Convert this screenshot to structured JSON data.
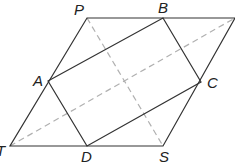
{
  "figure": {
    "type": "geometric-diagram",
    "colors": {
      "solid_line": "#333333",
      "dashed_line": "#b0b0b0",
      "label": "#222222",
      "background": "#ffffff"
    },
    "points": {
      "P": {
        "label": "P",
        "x": 87,
        "y": 18
      },
      "Q": {
        "label": "",
        "x": 235,
        "y": 18
      },
      "S": {
        "label": "S",
        "x": 163,
        "y": 146
      },
      "T": {
        "label": "T",
        "x": 10,
        "y": 146
      },
      "A": {
        "label": "A",
        "x": 48,
        "y": 81
      },
      "B": {
        "label": "B",
        "x": 163,
        "y": 18
      },
      "C": {
        "label": "C",
        "x": 201,
        "y": 82
      },
      "D": {
        "label": "D",
        "x": 87,
        "y": 146
      }
    },
    "labels": {
      "P": "P",
      "B": "B",
      "A": "A",
      "C": "C",
      "T": "T",
      "D": "D",
      "S": "S"
    }
  }
}
